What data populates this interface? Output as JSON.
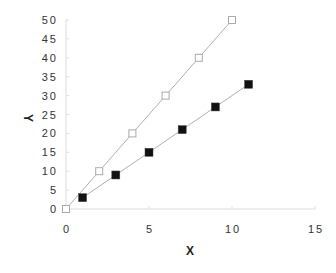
{
  "chart_data": {
    "type": "scatter",
    "title": "",
    "xlabel": "X",
    "ylabel": "Y",
    "xlim": [
      0,
      15
    ],
    "ylim": [
      0,
      50
    ],
    "x_ticks": [
      0,
      5,
      10,
      15
    ],
    "y_ticks": [
      0,
      5,
      10,
      15,
      20,
      25,
      30,
      35,
      40,
      45,
      50
    ],
    "grid": false,
    "legend": null,
    "series": [
      {
        "name": "open-squares",
        "marker": "open-square",
        "line": true,
        "color": "#aaaaaa",
        "x": [
          0,
          2,
          4,
          6,
          8,
          10
        ],
        "y": [
          0,
          10,
          20,
          30,
          40,
          50
        ]
      },
      {
        "name": "filled-squares",
        "marker": "filled-square",
        "line": true,
        "color": "#111111",
        "x": [
          1,
          3,
          5,
          7,
          9,
          11
        ],
        "y": [
          3,
          9,
          15,
          21,
          27,
          33
        ]
      }
    ]
  }
}
